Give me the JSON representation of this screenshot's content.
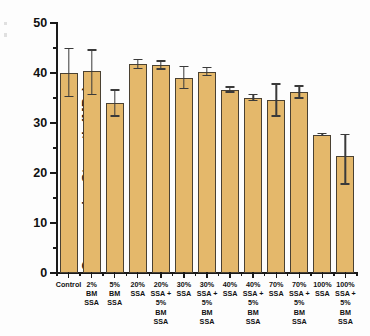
{
  "chart_data": {
    "type": "bar",
    "title": "",
    "xlabel": "",
    "ylabel": "Compressive Strength (MPa)",
    "ylim": [
      0,
      50
    ],
    "ytick_labels": [
      "0",
      "10",
      "20",
      "30",
      "40",
      "50"
    ],
    "ytick_values": [
      0,
      10,
      20,
      30,
      40,
      50
    ],
    "yminor_step": 5,
    "grid": false,
    "legend": null,
    "bar_color": "#E4B86B",
    "bar_edge_color": "#4A4132",
    "error_bar_color": "#3A3A3A",
    "axis_color": "#1A1A1A",
    "categories": [
      "Control",
      "2%\nBM\nSSA",
      "5%\nBM\nSSA",
      "20%\nSSA",
      "20%\nSSA +\n5%\nBM\nSSA",
      "30%\nSSA",
      "30%\nSSA +\n5%\nBM\nSSA",
      "40%\nSSA",
      "40%\nSSA +\n5%\nBM\nSSA",
      "70%\nSSA",
      "70%\nSSA +\n5%\nBM\nSSA",
      "100%\nSSA",
      "100%\nSSA +\n5%\nBM\nSSA"
    ],
    "values": [
      40.1,
      40.5,
      34.0,
      41.8,
      41.6,
      39.1,
      40.3,
      36.7,
      35.1,
      34.6,
      36.2,
      27.7,
      23.4
    ],
    "errors_upper": [
      4.8,
      4.1,
      2.6,
      0.9,
      0.8,
      2.2,
      0.8,
      0.5,
      0.6,
      3.2,
      1.2,
      0.25,
      4.3
    ],
    "errors_lower": [
      4.8,
      4.8,
      2.6,
      0.9,
      0.8,
      2.2,
      0.8,
      0.5,
      0.6,
      3.2,
      1.2,
      0.25,
      5.6
    ]
  }
}
